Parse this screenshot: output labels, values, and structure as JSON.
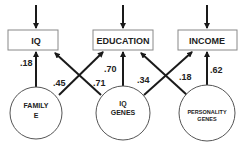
{
  "boxes": {
    "iq": "IQ",
    "education": "EDUCATION",
    "income": "INCOME"
  },
  "circles": {
    "family_e": [
      "FAMILY",
      "E"
    ],
    "iq_genes": [
      "IQ",
      "GENES"
    ],
    "personality_genes": [
      "PERSONALITY",
      "GENES"
    ]
  },
  "paths": {
    "family_e_to_iq": ".18",
    "family_e_to_education": ".45",
    "iq_genes_to_iq": ".71",
    "iq_genes_to_education": ".70",
    "iq_genes_to_income": ".34",
    "personality_genes_to_education": ".18",
    "personality_genes_to_income": ".62"
  },
  "colors": {
    "line": "#1a1a1a",
    "box_border": "#888888",
    "text": "#222222"
  }
}
